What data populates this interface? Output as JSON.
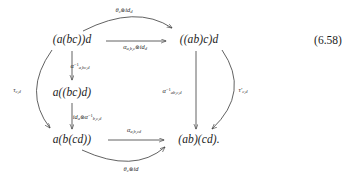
{
  "figure": {
    "kind": "commutative-diagram",
    "equation_number": "(6.58)",
    "nodes": [
      {
        "id": "top-left",
        "text": "(a(bc))d",
        "x": 72,
        "y": 40
      },
      {
        "id": "top-right",
        "text": "((ab)c)d",
        "x": 199,
        "y": 40
      },
      {
        "id": "mid-left",
        "text": "a((bc)d)",
        "x": 72,
        "y": 93
      },
      {
        "id": "bottom-left",
        "text": "a(b(cd))",
        "x": 72,
        "y": 140
      },
      {
        "id": "bottom-right",
        "text": "(ab)(cd).",
        "x": 199,
        "y": 140
      }
    ],
    "arrow_labels": [
      {
        "id": "theta-c-id-d-top",
        "x": 124,
        "y": 11,
        "parts": [
          {
            "t": "θ",
            "k": "base"
          },
          {
            "t": "c",
            "k": "sub"
          },
          {
            "t": "⊗",
            "k": "op"
          },
          {
            "t": "id",
            "k": "base"
          },
          {
            "t": "d",
            "k": "sub"
          }
        ]
      },
      {
        "id": "alpha-abc-id-d",
        "x": 135,
        "y": 48,
        "parts": [
          {
            "t": "α",
            "k": "base"
          },
          {
            "t": "a,b,c",
            "k": "sub"
          },
          {
            "t": "⊗",
            "k": "op"
          },
          {
            "t": "id",
            "k": "base"
          },
          {
            "t": "d",
            "k": "sub"
          }
        ]
      },
      {
        "id": "alpha-inv-a-bc-d",
        "x": 80,
        "y": 67,
        "parts": [
          {
            "t": "α",
            "k": "base"
          },
          {
            "t": "−1",
            "k": "sup"
          },
          {
            "t": "a,bc,d",
            "k": "sub"
          }
        ]
      },
      {
        "id": "id-a-alpha-inv-bcd",
        "x": 87,
        "y": 118,
        "parts": [
          {
            "t": "id",
            "k": "base"
          },
          {
            "t": "a",
            "k": "sub"
          },
          {
            "t": "⊗",
            "k": "op"
          },
          {
            "t": "α",
            "k": "base"
          },
          {
            "t": "−1",
            "k": "sup"
          },
          {
            "t": "b,c,d",
            "k": "sub"
          }
        ]
      },
      {
        "id": "tau-c-d",
        "x": 17,
        "y": 91,
        "parts": [
          {
            "t": "τ",
            "k": "base"
          },
          {
            "t": "c,d",
            "k": "sub"
          }
        ]
      },
      {
        "id": "tau-prime-c-d",
        "x": 243,
        "y": 91,
        "parts": [
          {
            "t": "τ′",
            "k": "base"
          },
          {
            "t": "c,d",
            "k": "sub"
          }
        ]
      },
      {
        "id": "alpha-inv-ab-c-d",
        "x": 172,
        "y": 92,
        "parts": [
          {
            "t": "α",
            "k": "base"
          },
          {
            "t": "−1",
            "k": "sup"
          },
          {
            "t": "ab,c,d",
            "k": "sub"
          }
        ]
      },
      {
        "id": "alpha-a-b-cd",
        "x": 134,
        "y": 131,
        "parts": [
          {
            "t": "α",
            "k": "base"
          },
          {
            "t": "a,b,cd",
            "k": "sub"
          }
        ]
      },
      {
        "id": "theta-c-id-bottom",
        "x": 131,
        "y": 170,
        "parts": [
          {
            "t": "θ",
            "k": "base"
          },
          {
            "t": "c",
            "k": "sub"
          },
          {
            "t": "⊗",
            "k": "op"
          },
          {
            "t": "id",
            "k": "base"
          }
        ]
      }
    ],
    "colors": {
      "ink": "#1c1c1c",
      "arrow": "#3a3a3a",
      "background": "#ffffff"
    }
  }
}
